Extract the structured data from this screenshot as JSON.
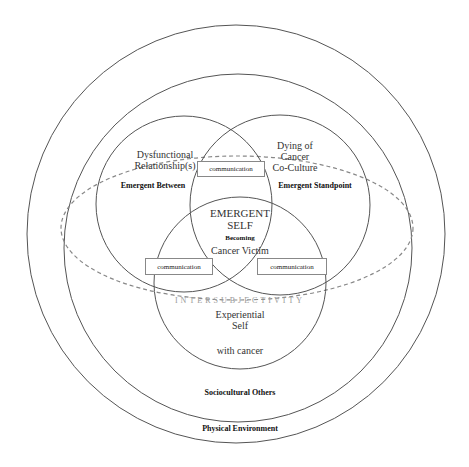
{
  "diagram": {
    "rings": {
      "outer_label": "Physical Environment",
      "middle_label": "Sociocultural Others"
    },
    "ellipse_label": "INTERSUBJECTIVITY",
    "venn": {
      "left": {
        "title_line1": "Dysfunctional",
        "title_line2": "Relationship(s)",
        "sub": "Emergent Between"
      },
      "right": {
        "title_line1": "Dying of",
        "title_line2": "Cancer",
        "title_line3": "Co-Culture",
        "sub": "Emergent Standpoint"
      },
      "bottom": {
        "title_line1": "Experiential",
        "title_line2": "Self",
        "sub": "with cancer"
      },
      "center": {
        "line1": "EMERGENT",
        "line2": "SELF",
        "line3": "Becoming",
        "line4": "Cancer Victim"
      }
    },
    "communication_boxes": [
      {
        "label": "communication"
      },
      {
        "label": "communication"
      },
      {
        "label": "communication"
      }
    ],
    "colors": {
      "line": "#555555",
      "dashed": "#888888",
      "background": "#ffffff"
    }
  }
}
